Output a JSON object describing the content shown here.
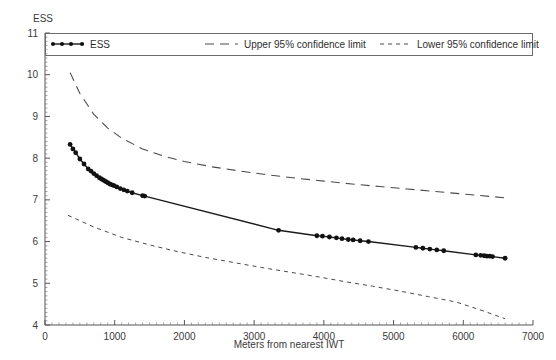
{
  "chart_data": {
    "type": "line",
    "title": "",
    "xlabel": "Meters from nearest IWT",
    "ylabel": "ESS",
    "xlim": [
      0,
      7000
    ],
    "ylim": [
      4,
      11
    ],
    "xticks": [
      0,
      1000,
      2000,
      3000,
      4000,
      5000,
      6000,
      7000
    ],
    "xtick_labels": [
      "0",
      "1000",
      "2000",
      "3000",
      "4000",
      "5000",
      "6000",
      "7000"
    ],
    "yticks": [
      4,
      5,
      6,
      7,
      8,
      9,
      10,
      11
    ],
    "ytick_labels": [
      "4",
      "5",
      "6",
      "7",
      "8",
      "9",
      "10",
      "11"
    ],
    "x_minor_tick_step": 100,
    "y_minor_tick_step": 0.1,
    "grid": false,
    "legend_position": "top-inside",
    "series": [
      {
        "name": "ESS",
        "style": "solid-with-markers",
        "color": "#111111",
        "x": [
          360,
          400,
          440,
          500,
          560,
          620,
          660,
          700,
          740,
          780,
          810,
          840,
          870,
          900,
          930,
          960,
          990,
          1030,
          1080,
          1130,
          1180,
          1250,
          1400,
          1430,
          3350,
          3900,
          3980,
          4080,
          4180,
          4260,
          4350,
          4420,
          4520,
          4640,
          5320,
          5420,
          5520,
          5620,
          5720,
          6180,
          6250,
          6300,
          6340,
          6380,
          6420,
          6600
        ],
        "y": [
          8.33,
          8.22,
          8.13,
          7.98,
          7.86,
          7.74,
          7.69,
          7.63,
          7.58,
          7.53,
          7.5,
          7.47,
          7.44,
          7.41,
          7.38,
          7.36,
          7.34,
          7.31,
          7.27,
          7.24,
          7.21,
          7.17,
          7.1,
          7.09,
          6.27,
          6.14,
          6.13,
          6.11,
          6.09,
          6.07,
          6.05,
          6.04,
          6.02,
          6.0,
          5.86,
          5.84,
          5.82,
          5.8,
          5.78,
          5.68,
          5.67,
          5.66,
          5.65,
          5.65,
          5.64,
          5.6
        ]
      },
      {
        "name": "Upper 95% confidence limit",
        "style": "long-dashed",
        "color": "#4a4a4a",
        "x": [
          360,
          500,
          700,
          900,
          1100,
          1400,
          1700,
          2000,
          2400,
          2800,
          3200,
          3600,
          4000,
          4400,
          4800,
          5200,
          5600,
          6000,
          6400,
          6600
        ],
        "y": [
          10.05,
          9.55,
          9.05,
          8.72,
          8.48,
          8.22,
          8.05,
          7.92,
          7.79,
          7.69,
          7.6,
          7.52,
          7.45,
          7.38,
          7.32,
          7.26,
          7.2,
          7.14,
          7.08,
          7.05
        ]
      },
      {
        "name": "Lower 95% confidence limit",
        "style": "short-dashed",
        "color": "#4a4a4a",
        "x": [
          330,
          700,
          1100,
          1500,
          1900,
          2300,
          2700,
          3100,
          3500,
          3900,
          4300,
          4700,
          5100,
          5500,
          5900,
          6300,
          6600
        ],
        "y": [
          6.63,
          6.35,
          6.1,
          5.92,
          5.76,
          5.62,
          5.5,
          5.38,
          5.27,
          5.16,
          5.04,
          4.93,
          4.81,
          4.68,
          4.55,
          4.33,
          4.15
        ]
      }
    ],
    "legend": [
      {
        "label": "ESS",
        "style": "solid-with-markers"
      },
      {
        "label": "Upper 95% confidence limit",
        "style": "long-dashed"
      },
      {
        "label": "Lower 95% confidence limit",
        "style": "short-dashed"
      }
    ]
  }
}
